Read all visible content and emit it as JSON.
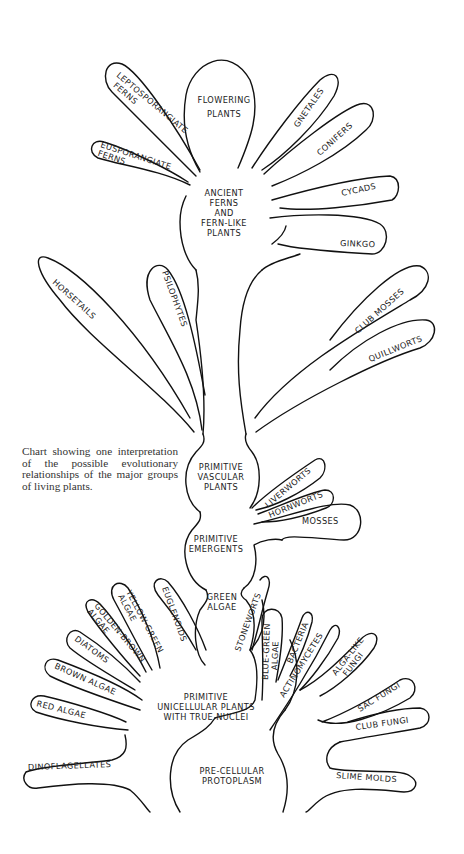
{
  "caption": "Chart showing one interpretation of the possible evolutionary relationships of the major groups of living plants.",
  "trunk": {
    "pre_cellular": [
      "PRE-CELLULAR",
      "PROTOPLASM"
    ],
    "unicellular": [
      "PRIMITIVE",
      "UNICELLULAR PLANTS",
      "WITH TRUE NUCLEI"
    ],
    "green_algae": [
      "GREEN",
      "ALGAE"
    ],
    "emergents": [
      "PRIMITIVE",
      "EMERGENTS"
    ],
    "vascular": [
      "PRIMITIVE",
      "VASCULAR",
      "PLANTS"
    ],
    "ancient_ferns": [
      "ANCIENT",
      "FERNS",
      "AND",
      "FERN-LIKE",
      "PLANTS"
    ],
    "flowering": [
      "FLOWERING",
      "PLANTS"
    ]
  },
  "branches": {
    "leptosporangiate": [
      "LEPTOSPORANGIATE",
      "FERNS"
    ],
    "eusporangiate": [
      "EUSPORANGIATE",
      "FERNS"
    ],
    "gnetales": "GNETALES",
    "conifers": "CONIFERS",
    "cycads": "CYCADS",
    "ginkgo": "GINKGO",
    "horsetails": "HORSETAILS",
    "psilophytes": "PSILOPHYTES",
    "club_mosses": "CLUB MOSSES",
    "quillworts": "QUILLWORTS",
    "liverworts": "LIVERWORTS",
    "hornworts": "HORNWORTS",
    "mosses": "MOSSES",
    "euglenoids": "EUGLENOIDS",
    "yellow_green": [
      "YELLOW-GREEN",
      "ALGAE"
    ],
    "golden_brown": [
      "GOLDEN-BROWN",
      "ALGAE"
    ],
    "diatoms": "DIATOMS",
    "brown_algae": "BROWN ALGAE",
    "red_algae": "RED ALGAE",
    "dinoflagellates": "DINOFLAGELLATES",
    "stoneworts": "STONEWORTS",
    "blue_green": [
      "BLUE-GREEN",
      "ALGAE"
    ],
    "bacteria": "BACTERIA",
    "actinomycetes": "ACTINOMYCETES",
    "alga_like_fungi": [
      "ALGA-LIKE",
      "FUNGI"
    ],
    "sac_fungi": "SAC FUNGI",
    "club_fungi": "CLUB FUNGI",
    "slime_molds": "SLIME MOLDS"
  }
}
